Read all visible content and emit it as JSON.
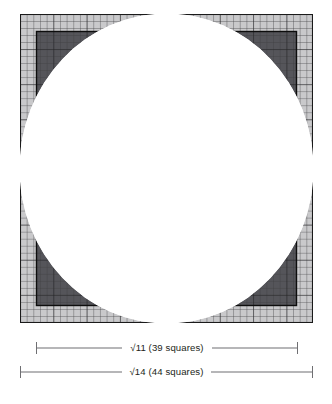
{
  "figure": {
    "background_color": "#ffffff",
    "ink_color": "#231f20",
    "rule_color": "#6f6f72"
  },
  "diagram": {
    "type": "geometric-construction",
    "outer_square": {
      "name": "outer-grid-square",
      "side_squares": 44,
      "side_label": "√14",
      "fill": "#ffffff",
      "grid_line_color": "#3a3a3c"
    },
    "inner_square": {
      "name": "inner-shaded-square",
      "side_squares": 39,
      "side_label": "√11",
      "fill": "#6b6b6e",
      "outline_color": "#1a1a1a",
      "inset_squares": 2.5
    },
    "circle": {
      "name": "inscribed-circle",
      "diameter_squares": 44,
      "fill": "#ffffff",
      "stroke": "none"
    },
    "grid": {
      "columns": 44,
      "rows": 44,
      "cell_size_px": 6.66,
      "visible": true
    },
    "corner_shading": {
      "description": "four shaded corner regions between the circle and the squares",
      "outer_corner_fill": "#b9b9bb",
      "inner_corner_fill": "#5d5d60"
    }
  },
  "dimensions": [
    {
      "id": "dim-inner",
      "label": "√11 (39 squares)",
      "value_label": "√11",
      "squares": 39,
      "span_px": 262
    },
    {
      "id": "dim-outer",
      "label": "√14 (44 squares)",
      "value_label": "√14",
      "squares": 44,
      "span_px": 293
    }
  ]
}
